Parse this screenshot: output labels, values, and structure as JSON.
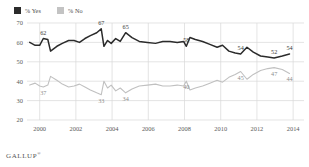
{
  "source": {
    "brand": "GALLUP",
    "trademark": "®"
  },
  "legend": {
    "position": "top-left",
    "items": [
      {
        "label": "% Yes",
        "color": "#2b2b2b",
        "icon": "square-swatch"
      },
      {
        "label": "% No",
        "color": "#c3c3c3",
        "icon": "square-swatch"
      }
    ]
  },
  "axes": {
    "y_ticks": [
      "70",
      "60",
      "50",
      "40",
      "30",
      "20"
    ],
    "x_ticks": [
      "2000",
      "2002",
      "2004",
      "2006",
      "2008",
      "2010",
      "2012",
      "2014"
    ]
  },
  "chart_data": {
    "type": "line",
    "title": "",
    "subtitle": "",
    "xlabel": "",
    "ylabel": "",
    "xlim": [
      1999.3,
      2014.6
    ],
    "ylim": [
      20,
      70
    ],
    "grid": true,
    "legend_position": "top-left",
    "series": [
      {
        "name": "% Yes",
        "color": "#2b2b2b",
        "points": [
          {
            "x": 1999.45,
            "y": 60
          },
          {
            "x": 1999.75,
            "y": 58.5
          },
          {
            "x": 2000.0,
            "y": 58.5
          },
          {
            "x": 2000.2,
            "y": 62,
            "label": "62"
          },
          {
            "x": 2000.45,
            "y": 61.5
          },
          {
            "x": 2000.6,
            "y": 55.5
          },
          {
            "x": 2000.95,
            "y": 58
          },
          {
            "x": 2001.25,
            "y": 59.5
          },
          {
            "x": 2001.6,
            "y": 61
          },
          {
            "x": 2001.9,
            "y": 61
          },
          {
            "x": 2002.2,
            "y": 60
          },
          {
            "x": 2002.5,
            "y": 62
          },
          {
            "x": 2002.8,
            "y": 63.5
          },
          {
            "x": 2003.15,
            "y": 65
          },
          {
            "x": 2003.4,
            "y": 67,
            "label": "67"
          },
          {
            "x": 2003.55,
            "y": 58
          },
          {
            "x": 2003.75,
            "y": 61
          },
          {
            "x": 2003.95,
            "y": 59.5
          },
          {
            "x": 2004.2,
            "y": 62
          },
          {
            "x": 2004.45,
            "y": 60.5
          },
          {
            "x": 2004.75,
            "y": 65,
            "label": "65"
          },
          {
            "x": 2005.1,
            "y": 62.5
          },
          {
            "x": 2005.5,
            "y": 60.5
          },
          {
            "x": 2005.95,
            "y": 60
          },
          {
            "x": 2006.4,
            "y": 59.5
          },
          {
            "x": 2006.8,
            "y": 60.5
          },
          {
            "x": 2007.2,
            "y": 60.5
          },
          {
            "x": 2007.6,
            "y": 60
          },
          {
            "x": 2007.95,
            "y": 60.5
          },
          {
            "x": 2008.1,
            "y": 58,
            "label": "58"
          },
          {
            "x": 2008.3,
            "y": 62.5
          },
          {
            "x": 2008.6,
            "y": 61.5
          },
          {
            "x": 2009.0,
            "y": 60.5
          },
          {
            "x": 2009.4,
            "y": 59
          },
          {
            "x": 2009.8,
            "y": 57.5
          },
          {
            "x": 2010.1,
            "y": 58.5
          },
          {
            "x": 2010.45,
            "y": 55.5
          },
          {
            "x": 2010.8,
            "y": 54.5
          },
          {
            "x": 2011.1,
            "y": 54,
            "label": "54"
          },
          {
            "x": 2011.45,
            "y": 57.5
          },
          {
            "x": 2011.8,
            "y": 55
          },
          {
            "x": 2012.2,
            "y": 53
          },
          {
            "x": 2012.6,
            "y": 52.5
          },
          {
            "x": 2012.95,
            "y": 52,
            "label": "52"
          },
          {
            "x": 2013.4,
            "y": 53
          },
          {
            "x": 2013.8,
            "y": 54,
            "label": "54"
          }
        ]
      },
      {
        "name": "% No",
        "color": "#c0c0c0",
        "points": [
          {
            "x": 1999.45,
            "y": 38
          },
          {
            "x": 1999.75,
            "y": 39
          },
          {
            "x": 2000.0,
            "y": 37.5
          },
          {
            "x": 2000.2,
            "y": 37,
            "label": "37"
          },
          {
            "x": 2000.45,
            "y": 38
          },
          {
            "x": 2000.6,
            "y": 42.5
          },
          {
            "x": 2000.95,
            "y": 40.5
          },
          {
            "x": 2001.25,
            "y": 38.5
          },
          {
            "x": 2001.6,
            "y": 37
          },
          {
            "x": 2001.9,
            "y": 37.5
          },
          {
            "x": 2002.2,
            "y": 38.5
          },
          {
            "x": 2002.5,
            "y": 37
          },
          {
            "x": 2002.8,
            "y": 35.5
          },
          {
            "x": 2003.15,
            "y": 34
          },
          {
            "x": 2003.4,
            "y": 33,
            "label": "33"
          },
          {
            "x": 2003.55,
            "y": 40
          },
          {
            "x": 2003.75,
            "y": 36.5
          },
          {
            "x": 2003.95,
            "y": 38
          },
          {
            "x": 2004.2,
            "y": 35
          },
          {
            "x": 2004.45,
            "y": 36.5
          },
          {
            "x": 2004.75,
            "y": 34,
            "label": "34"
          },
          {
            "x": 2005.1,
            "y": 36
          },
          {
            "x": 2005.5,
            "y": 37.5
          },
          {
            "x": 2005.95,
            "y": 38
          },
          {
            "x": 2006.4,
            "y": 38.5
          },
          {
            "x": 2006.8,
            "y": 37.5
          },
          {
            "x": 2007.2,
            "y": 37.5
          },
          {
            "x": 2007.6,
            "y": 38
          },
          {
            "x": 2007.95,
            "y": 37.5
          },
          {
            "x": 2008.1,
            "y": 40,
            "label": "40"
          },
          {
            "x": 2008.3,
            "y": 35.5
          },
          {
            "x": 2008.6,
            "y": 36.5
          },
          {
            "x": 2009.0,
            "y": 37.5
          },
          {
            "x": 2009.4,
            "y": 39
          },
          {
            "x": 2009.8,
            "y": 40.5
          },
          {
            "x": 2010.1,
            "y": 39.5
          },
          {
            "x": 2010.45,
            "y": 42
          },
          {
            "x": 2010.8,
            "y": 43.5
          },
          {
            "x": 2011.1,
            "y": 45,
            "label": "45"
          },
          {
            "x": 2011.45,
            "y": 41
          },
          {
            "x": 2011.8,
            "y": 43.5
          },
          {
            "x": 2012.2,
            "y": 45.5
          },
          {
            "x": 2012.6,
            "y": 46.5
          },
          {
            "x": 2012.95,
            "y": 47,
            "label": "47"
          },
          {
            "x": 2013.4,
            "y": 46
          },
          {
            "x": 2013.8,
            "y": 44,
            "label": "44"
          }
        ]
      }
    ]
  }
}
